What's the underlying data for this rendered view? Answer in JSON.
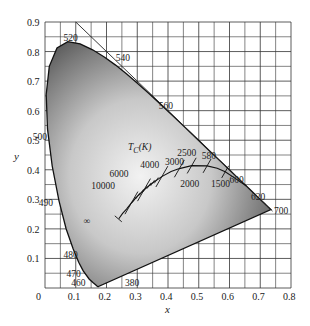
{
  "figure": {
    "title": "",
    "xlabel": "x",
    "ylabel": "y",
    "origin_label": "0",
    "x_ticks": [
      "0.1",
      "0.2",
      "0.3",
      "0.4",
      "0.5",
      "0.6",
      "0.7",
      "0.8"
    ],
    "y_ticks": [
      "0.1",
      "0.2",
      "0.3",
      "0.4",
      "0.5",
      "0.6",
      "0.7",
      "0.8",
      "0.9"
    ],
    "locus_title": "T",
    "locus_title_sub": "C",
    "locus_title_unit": "(K)",
    "wavelength_labels": [
      {
        "text": "380",
        "x": 0.26,
        "y": 0.02
      },
      {
        "text": "460",
        "x": 0.085,
        "y": 0.02
      },
      {
        "text": "470",
        "x": 0.07,
        "y": 0.05
      },
      {
        "text": "480",
        "x": 0.06,
        "y": 0.115
      },
      {
        "text": "490",
        "x": -0.02,
        "y": 0.29
      },
      {
        "text": "500",
        "x": -0.04,
        "y": 0.515
      },
      {
        "text": "520",
        "x": 0.06,
        "y": 0.85
      },
      {
        "text": "540",
        "x": 0.23,
        "y": 0.78
      },
      {
        "text": "560",
        "x": 0.37,
        "y": 0.62
      },
      {
        "text": "580",
        "x": 0.51,
        "y": 0.45
      },
      {
        "text": "600",
        "x": 0.6,
        "y": 0.37
      },
      {
        "text": "620",
        "x": 0.67,
        "y": 0.31
      },
      {
        "text": "700",
        "x": 0.745,
        "y": 0.265
      }
    ],
    "temperature_labels": [
      {
        "text": "10000",
        "x": 0.15,
        "y": 0.35
      },
      {
        "text": "6000",
        "x": 0.21,
        "y": 0.39
      },
      {
        "text": "4000",
        "x": 0.31,
        "y": 0.42
      },
      {
        "text": "3000",
        "x": 0.39,
        "y": 0.43
      },
      {
        "text": "2500",
        "x": 0.43,
        "y": 0.46
      },
      {
        "text": "2000",
        "x": 0.44,
        "y": 0.355
      },
      {
        "text": "1500",
        "x": 0.54,
        "y": 0.355
      },
      {
        "text": "∞",
        "x": 0.125,
        "y": 0.23
      }
    ]
  },
  "chart_data": {
    "type": "scatter",
    "xlabel": "x",
    "ylabel": "y",
    "xlim": [
      0,
      0.8
    ],
    "ylim": [
      0,
      0.9
    ],
    "grid": true,
    "grid_step": 0.05,
    "series": [
      {
        "name": "spectral locus (nm)",
        "points": [
          {
            "nm": 380,
            "x": 0.1741,
            "y": 0.005
          },
          {
            "nm": 460,
            "x": 0.144,
            "y": 0.0297
          },
          {
            "nm": 470,
            "x": 0.1241,
            "y": 0.0578
          },
          {
            "nm": 480,
            "x": 0.0913,
            "y": 0.1327
          },
          {
            "nm": 490,
            "x": 0.0454,
            "y": 0.295
          },
          {
            "nm": 500,
            "x": 0.0082,
            "y": 0.5384
          },
          {
            "nm": 520,
            "x": 0.0743,
            "y": 0.8338
          },
          {
            "nm": 540,
            "x": 0.2296,
            "y": 0.7543
          },
          {
            "nm": 560,
            "x": 0.3731,
            "y": 0.6245
          },
          {
            "nm": 580,
            "x": 0.5125,
            "y": 0.4866
          },
          {
            "nm": 600,
            "x": 0.627,
            "y": 0.3725
          },
          {
            "nm": 620,
            "x": 0.6915,
            "y": 0.3083
          },
          {
            "nm": 700,
            "x": 0.7347,
            "y": 0.2653
          }
        ]
      },
      {
        "name": "Planckian locus T_C (K)",
        "points": [
          {
            "T": "∞",
            "x": 0.24,
            "y": 0.234
          },
          {
            "T": 10000,
            "x": 0.281,
            "y": 0.288
          },
          {
            "T": 6000,
            "x": 0.322,
            "y": 0.332
          },
          {
            "T": 4000,
            "x": 0.38,
            "y": 0.377
          },
          {
            "T": 3000,
            "x": 0.437,
            "y": 0.404
          },
          {
            "T": 2500,
            "x": 0.477,
            "y": 0.414
          },
          {
            "T": 2000,
            "x": 0.527,
            "y": 0.413
          },
          {
            "T": 1500,
            "x": 0.586,
            "y": 0.393
          }
        ]
      }
    ]
  }
}
